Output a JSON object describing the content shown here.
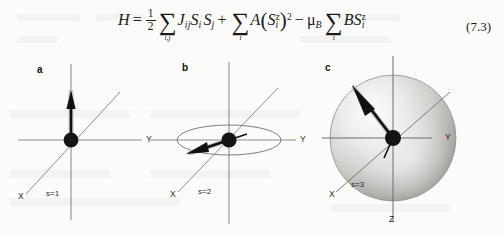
{
  "equation": {
    "number": "(7.3)",
    "latex": "H = 1/2 Sum_{i,j} J_ij S_i S_j + Sum_i A (S_i^z)^2 - mu_B Sum_i B S_i^z",
    "parts": {
      "hamiltonian": "H",
      "equals": "=",
      "half_num": "1",
      "half_den": "2",
      "sum_sigma": "∑",
      "sum1_index": "i,j",
      "exchange_coupling": "J",
      "exchange_sub": "ij",
      "spin_symbol": "S",
      "spin_i_sub": "i",
      "spin_j_sub": "j",
      "plus": "+",
      "sum2_index": "i",
      "anisotropy_constant": "A",
      "paren_open": "(",
      "paren_close": ")",
      "z_super": "z",
      "square": "2",
      "minus": "−",
      "mu": "μ",
      "mu_sub": "B",
      "sum3_index": "i",
      "field_symbol": "B"
    }
  },
  "panels": [
    {
      "id": "a",
      "letter": "a",
      "spin_label": "s=1",
      "anisotropy_type": "uniaxial-ising",
      "axes": [
        {
          "name": "X",
          "label": "X"
        },
        {
          "name": "Y",
          "label": "Y"
        }
      ],
      "spin_vector": {
        "direction": "up",
        "angle_deg": 90,
        "length_px": 38
      },
      "description": "single vertical easy axis with spin arrow pointing up"
    },
    {
      "id": "b",
      "letter": "b",
      "spin_label": "s=2",
      "anisotropy_type": "easy-plane-xy",
      "axes": [
        {
          "name": "X",
          "label": "X"
        },
        {
          "name": "Y",
          "label": "Y"
        }
      ],
      "spin_vector": {
        "direction": "down-left",
        "angle_deg": 200,
        "length_px": 40
      },
      "description": "easy plane drawn as ellipse with spin arrow lying in plane"
    },
    {
      "id": "c",
      "letter": "c",
      "spin_label": "s=3",
      "anisotropy_type": "isotropic-heisenberg",
      "axes": [
        {
          "name": "X",
          "label": "X"
        },
        {
          "name": "Y",
          "label": "Y"
        },
        {
          "name": "Z",
          "label": "Z"
        }
      ],
      "spin_vector": {
        "direction": "up-left",
        "angle_deg": 145,
        "length_px": 52
      },
      "description": "shaded sphere of isotropic directions with spin arrow up-left"
    }
  ],
  "colors": {
    "ink": "#1a1a1a",
    "axis": "#8d8d8d",
    "sphere_light": "#f2f2f0",
    "sphere_mid": "#bdbdba",
    "sphere_dark": "#8a8a87",
    "page": "#fbfbfa"
  }
}
